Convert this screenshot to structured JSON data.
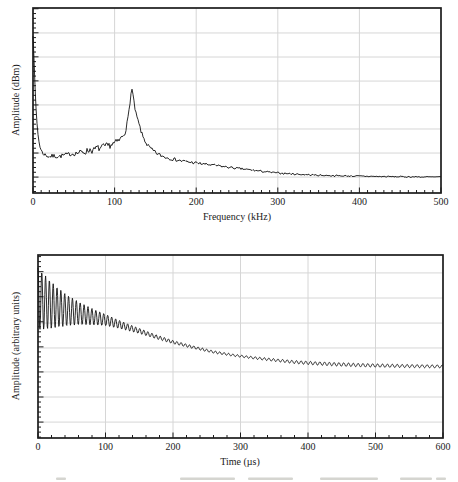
{
  "figure": {
    "background": "#ffffff"
  },
  "colors": {
    "axis": "#1c1c1c",
    "grid": "#d6d6d6",
    "trace": "#141414",
    "text": "#1a1a1a",
    "caption_fragment": "#b9b9b0"
  },
  "chart_data": [
    {
      "type": "line",
      "id": "frequency-spectrum",
      "title": "",
      "xlabel": "Frequency (kHz)",
      "ylabel": "Amplitude (dBm)",
      "x_range": [
        0,
        500
      ],
      "x_ticks": [
        0,
        100,
        200,
        300,
        400,
        500
      ],
      "x_minor_step": 10,
      "grid": true,
      "y_axis_tick_labels": "none shown (unlabeled dBm axis, normalized 0-1 here)",
      "y_gridlines_norm": [
        0.086,
        0.216,
        0.346,
        0.476,
        0.605,
        0.735,
        0.865
      ],
      "y_minor_per_major": 5,
      "peak": {
        "frequency_kHz": 120,
        "height_norm": 0.567
      },
      "series": [
        {
          "name": "spectrum",
          "noise_seed": 7,
          "anchors_norm": [
            [
              0,
              0.85
            ],
            [
              0.8,
              0.78
            ],
            [
              1.6,
              0.68
            ],
            [
              2.5,
              0.57
            ],
            [
              3.5,
              0.47
            ],
            [
              5,
              0.37
            ],
            [
              6.5,
              0.3
            ],
            [
              8,
              0.26
            ],
            [
              10,
              0.23
            ],
            [
              12,
              0.215
            ],
            [
              16,
              0.203
            ],
            [
              20,
              0.197
            ],
            [
              26,
              0.2
            ],
            [
              32,
              0.197
            ],
            [
              38,
              0.205
            ],
            [
              45,
              0.21
            ],
            [
              52,
              0.214
            ],
            [
              58,
              0.22
            ],
            [
              64,
              0.222
            ],
            [
              70,
              0.235
            ],
            [
              74,
              0.228
            ],
            [
              78,
              0.245
            ],
            [
              82,
              0.24
            ],
            [
              86,
              0.25
            ],
            [
              90,
              0.252
            ],
            [
              94,
              0.258
            ],
            [
              98,
              0.265
            ],
            [
              102,
              0.275
            ],
            [
              106,
              0.285
            ],
            [
              110,
              0.31
            ],
            [
              113,
              0.33
            ],
            [
              116,
              0.39
            ],
            [
              118,
              0.46
            ],
            [
              119.5,
              0.515
            ],
            [
              121,
              0.567
            ],
            [
              122.5,
              0.53
            ],
            [
              124,
              0.48
            ],
            [
              126,
              0.43
            ],
            [
              128,
              0.4
            ],
            [
              131,
              0.355
            ],
            [
              134,
              0.31
            ],
            [
              137,
              0.285
            ],
            [
              140,
              0.26
            ],
            [
              144,
              0.24
            ],
            [
              148,
              0.225
            ],
            [
              153,
              0.21
            ],
            [
              158,
              0.2
            ],
            [
              165,
              0.19
            ],
            [
              172,
              0.183
            ],
            [
              180,
              0.175
            ],
            [
              190,
              0.168
            ],
            [
              200,
              0.162
            ],
            [
              212,
              0.155
            ],
            [
              225,
              0.148
            ],
            [
              238,
              0.14
            ],
            [
              250,
              0.133
            ],
            [
              262,
              0.127
            ],
            [
              275,
              0.12
            ],
            [
              288,
              0.113
            ],
            [
              300,
              0.108
            ],
            [
              315,
              0.104
            ],
            [
              330,
              0.1
            ],
            [
              350,
              0.096
            ],
            [
              375,
              0.093
            ],
            [
              400,
              0.091
            ],
            [
              425,
              0.089
            ],
            [
              450,
              0.088
            ],
            [
              475,
              0.087
            ],
            [
              500,
              0.086
            ]
          ],
          "noise_amp_anchors": [
            [
              0,
              0.002
            ],
            [
              5,
              0.005
            ],
            [
              10,
              0.009
            ],
            [
              20,
              0.012
            ],
            [
              30,
              0.012
            ],
            [
              45,
              0.011
            ],
            [
              60,
              0.015
            ],
            [
              70,
              0.019
            ],
            [
              80,
              0.017
            ],
            [
              90,
              0.019
            ],
            [
              100,
              0.017
            ],
            [
              110,
              0.015
            ],
            [
              118,
              0.011
            ],
            [
              125,
              0.011
            ],
            [
              135,
              0.013
            ],
            [
              145,
              0.011
            ],
            [
              160,
              0.01
            ],
            [
              180,
              0.009
            ],
            [
              200,
              0.008
            ],
            [
              250,
              0.006
            ],
            [
              300,
              0.005
            ],
            [
              400,
              0.004
            ],
            [
              500,
              0.0035
            ]
          ]
        }
      ]
    },
    {
      "type": "line",
      "id": "time-waveform",
      "title": "",
      "xlabel": "Time (µs)",
      "ylabel": "Amplitude (arbitrary units)",
      "x_range": [
        0,
        600
      ],
      "x_ticks": [
        0,
        100,
        200,
        300,
        400,
        500,
        600
      ],
      "x_minor_step": 20,
      "grid": true,
      "y_axis_tick_labels": "none shown (arbitrary units, normalized 0-1 here)",
      "y_gridlines_norm": [
        0.087,
        0.224,
        0.361,
        0.492,
        0.628,
        0.765,
        0.902
      ],
      "y_minor_per_major": 5,
      "series": [
        {
          "name": "ringdown-signal",
          "model": "baseline(t) + envelope(t) * cos(phase(t))",
          "baseline_anchors_norm": [
            [
              0,
              0.76
            ],
            [
              20,
              0.725
            ],
            [
              40,
              0.7
            ],
            [
              60,
              0.682
            ],
            [
              80,
              0.663
            ],
            [
              100,
              0.645
            ],
            [
              125,
              0.615
            ],
            [
              150,
              0.585
            ],
            [
              175,
              0.553
            ],
            [
              200,
              0.524
            ],
            [
              230,
              0.496
            ],
            [
              260,
              0.47
            ],
            [
              290,
              0.452
            ],
            [
              320,
              0.438
            ],
            [
              350,
              0.426
            ],
            [
              380,
              0.415
            ],
            [
              410,
              0.408
            ],
            [
              440,
              0.403
            ],
            [
              470,
              0.399
            ],
            [
              500,
              0.396
            ],
            [
              550,
              0.393
            ],
            [
              600,
              0.391
            ]
          ],
          "envelope_anchors_norm": [
            [
              0,
              0.17
            ],
            [
              10,
              0.148
            ],
            [
              20,
              0.126
            ],
            [
              30,
              0.106
            ],
            [
              40,
              0.089
            ],
            [
              50,
              0.075
            ],
            [
              60,
              0.063
            ],
            [
              72,
              0.051
            ],
            [
              85,
              0.041
            ],
            [
              100,
              0.031
            ],
            [
              115,
              0.024
            ],
            [
              130,
              0.019
            ],
            [
              150,
              0.014
            ],
            [
              175,
              0.011
            ],
            [
              200,
              0.009
            ],
            [
              250,
              0.007
            ],
            [
              300,
              0.006
            ],
            [
              350,
              0.0075
            ],
            [
              400,
              0.009
            ],
            [
              450,
              0.0095
            ],
            [
              500,
              0.009
            ],
            [
              550,
              0.0085
            ],
            [
              600,
              0.008
            ]
          ],
          "period_us_anchors": [
            [
              0,
              5.6
            ],
            [
              150,
              6.0
            ],
            [
              300,
              6.6
            ],
            [
              450,
              7.1
            ],
            [
              600,
              7.5
            ]
          ]
        }
      ]
    }
  ],
  "footer": {
    "cutoff_caption_marks": [
      [
        56,
        10
      ],
      [
        180,
        55
      ],
      [
        248,
        45
      ],
      [
        320,
        58
      ],
      [
        400,
        32
      ],
      [
        436,
        10
      ]
    ]
  }
}
